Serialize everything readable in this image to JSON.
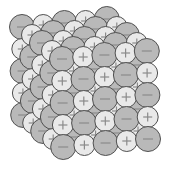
{
  "diagram": {
    "grid": {
      "layers": 5,
      "rows": 5,
      "cols": 5
    },
    "ions": {
      "anion": {
        "sign": "−",
        "fill": "#b9b9b9",
        "radius": 12.5
      },
      "cation": {
        "sign": "+",
        "fill": "#e9e9e9",
        "radius": 10.5
      }
    },
    "colors": {
      "outline": "#505050",
      "sign": "#8a8a8a",
      "background": "#ffffff"
    },
    "geometry": {
      "front_origin": [
        62,
        59
      ],
      "col_step": [
        21.2,
        -2.0
      ],
      "row_step": [
        0.3,
        22.0
      ],
      "layer_step": [
        -10.0,
        -8.0
      ]
    },
    "front_face_pattern": [
      [
        "-",
        "+",
        "-",
        "+",
        "-"
      ],
      [
        "+",
        "-",
        "+",
        "-",
        "+"
      ],
      [
        "-",
        "+",
        "-",
        "+",
        "-"
      ],
      [
        "+",
        "-",
        "+",
        "-",
        "+"
      ],
      [
        "-",
        "+",
        "-",
        "+",
        "-"
      ]
    ]
  }
}
